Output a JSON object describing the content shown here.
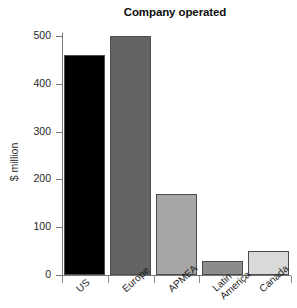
{
  "chart_data": {
    "type": "bar",
    "title": "Company operated",
    "xlabel": "",
    "ylabel": "$ million",
    "categories": [
      "US",
      "Europe",
      "APMEA",
      "Latin America",
      "Canada"
    ],
    "values": [
      460,
      500,
      170,
      30,
      50
    ],
    "ylim": [
      0,
      500
    ],
    "yticks": [
      0,
      100,
      200,
      300,
      400,
      500
    ],
    "ytick_labels": [
      "0",
      "100",
      "200",
      "300",
      "400",
      "500"
    ],
    "grid": false,
    "legend": "none",
    "bar_colors": [
      "#000000",
      "#636363",
      "#a6a6a6",
      "#8c8c8c",
      "#d9d9d9"
    ],
    "bar_edge_color": "#4d4d4d",
    "axis_color": "#777777",
    "series": [
      {
        "name": "Company operated",
        "points": [
          {
            "category": "US",
            "value": 460,
            "color": "#000000"
          },
          {
            "category": "Europe",
            "value": 500,
            "color": "#636363"
          },
          {
            "category": "APMEA",
            "value": 170,
            "color": "#a6a6a6"
          },
          {
            "category": "Latin America",
            "value": 30,
            "color": "#8c8c8c"
          },
          {
            "category": "Canada",
            "value": 50,
            "color": "#d9d9d9"
          }
        ]
      }
    ],
    "category_label_lines": [
      [
        "US"
      ],
      [
        "Europe"
      ],
      [
        "APMEA"
      ],
      [
        "Latin",
        "America"
      ],
      [
        "Canada"
      ]
    ]
  }
}
